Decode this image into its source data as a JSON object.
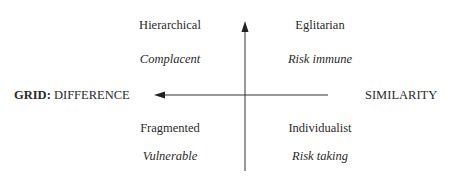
{
  "diagram": {
    "vertical_axis": {
      "direction": "up"
    },
    "horizontal_axis": {
      "direction": "left",
      "left_label_prefix": "GRID:",
      "left_label": "DIFFERENCE",
      "right_label": "SIMILARITY"
    },
    "quadrants": {
      "top_left": {
        "title": "Hierarchical",
        "subtitle": "Complacent"
      },
      "top_right": {
        "title": "Eglitarian",
        "subtitle": "Risk immune"
      },
      "bottom_left": {
        "title": "Fragmented",
        "subtitle": "Vulnerable"
      },
      "bottom_right": {
        "title": "Individualist",
        "subtitle": "Risk taking"
      }
    },
    "colors": {
      "text": "#2a2a2a",
      "axis": "#333333",
      "background": "#ffffff"
    }
  }
}
